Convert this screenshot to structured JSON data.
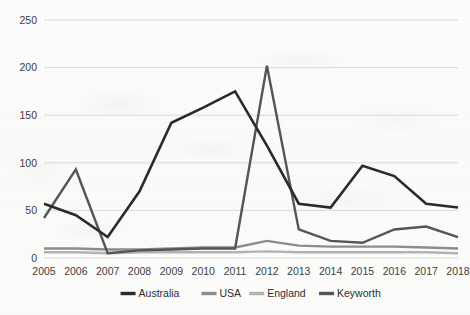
{
  "chart_data": {
    "type": "line",
    "title": "",
    "subtitle": "",
    "xlabel": "",
    "ylabel": "",
    "categories": [
      "2005",
      "2006",
      "2007",
      "2008",
      "2009",
      "2010",
      "2011",
      "2012",
      "2013",
      "2014",
      "2015",
      "2016",
      "2017",
      "2018"
    ],
    "x": [
      2005,
      2006,
      2007,
      2008,
      2009,
      2010,
      2011,
      2012,
      2013,
      2014,
      2015,
      2016,
      2017,
      2018
    ],
    "ylim": [
      0,
      250
    ],
    "xlim": [
      2005,
      2018
    ],
    "yticks": [
      0,
      50,
      100,
      150,
      200,
      250
    ],
    "ytick_labels": [
      "0",
      "50",
      "100",
      "150",
      "200",
      "250"
    ],
    "grid": "horizontal-only",
    "legend_position": "bottom",
    "series": [
      {
        "name": "Australia",
        "color": "#2a2a2a",
        "stroke_width": 2.6,
        "values": [
          57,
          45,
          22,
          70,
          142,
          158,
          175,
          118,
          57,
          53,
          97,
          86,
          57,
          53
        ]
      },
      {
        "name": "USA",
        "color": "#8c8c8c",
        "stroke_width": 2.4,
        "values": [
          10,
          10,
          9,
          9,
          10,
          11,
          11,
          18,
          13,
          12,
          12,
          12,
          11,
          10
        ]
      },
      {
        "name": "England",
        "color": "#b3b3b3",
        "stroke_width": 2.4,
        "values": [
          6,
          6,
          5,
          6,
          6,
          6,
          6,
          7,
          6,
          6,
          6,
          6,
          6,
          5
        ]
      },
      {
        "name": "Keyworth",
        "color": "#555555",
        "stroke_width": 2.4,
        "values": [
          42,
          93,
          5,
          8,
          9,
          10,
          10,
          202,
          30,
          18,
          16,
          30,
          33,
          22
        ]
      }
    ]
  },
  "legend": {
    "items": [
      {
        "label": "Australia",
        "color": "#2a2a2a"
      },
      {
        "label": "USA",
        "color": "#8c8c8c"
      },
      {
        "label": "England",
        "color": "#b3b3b3"
      },
      {
        "label": "Keyworth",
        "color": "#555555"
      }
    ]
  }
}
